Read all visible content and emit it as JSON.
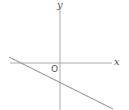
{
  "diagram": {
    "type": "coordinate-plane",
    "axes": {
      "x_label": "x",
      "y_label": "y",
      "origin_label": "O"
    },
    "line": {
      "description": "straight line with negative slope, negative y-intercept, negative x-intercept",
      "slope_sign": "negative",
      "y_intercept_sign": "negative",
      "x_intercept_sign": "negative"
    },
    "colors": {
      "axis": "#999999",
      "line": "#777777",
      "text": "#555555"
    }
  }
}
